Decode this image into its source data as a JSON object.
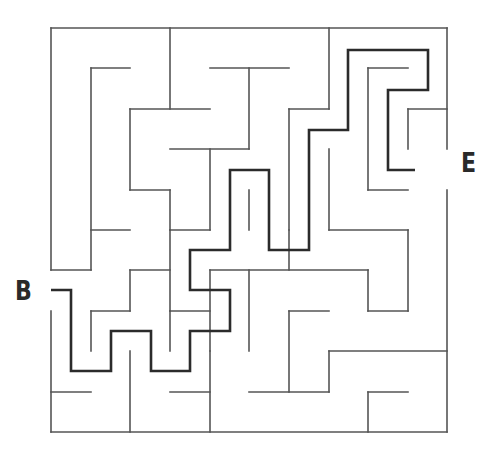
{
  "puzzle": {
    "type": "maze",
    "start_label": "B",
    "end_label": "E",
    "colors": {
      "wall": "#555555",
      "path": "#2b2b2b",
      "background": "#ffffff"
    },
    "walls": [
      [
        51,
        28,
        447,
        28
      ],
      [
        51,
        28,
        51,
        270
      ],
      [
        51,
        311,
        51,
        432
      ],
      [
        51,
        432,
        447,
        432
      ],
      [
        447,
        28,
        447,
        149
      ],
      [
        447,
        190,
        447,
        432
      ],
      [
        170,
        28,
        170,
        109
      ],
      [
        329,
        28,
        329,
        109
      ],
      [
        91,
        68,
        130,
        68
      ],
      [
        91,
        68,
        91,
        270
      ],
      [
        210,
        68,
        289,
        68
      ],
      [
        249,
        68,
        249,
        149
      ],
      [
        289,
        109,
        329,
        109
      ],
      [
        289,
        109,
        289,
        230
      ],
      [
        130,
        109,
        210,
        109
      ],
      [
        130,
        109,
        130,
        190
      ],
      [
        130,
        190,
        170,
        190
      ],
      [
        170,
        190,
        170,
        230
      ],
      [
        170,
        149,
        249,
        149
      ],
      [
        210,
        149,
        210,
        230
      ],
      [
        170,
        230,
        210,
        230
      ],
      [
        170,
        230,
        170,
        311
      ],
      [
        51,
        270,
        91,
        270
      ],
      [
        91,
        230,
        130,
        230
      ],
      [
        368,
        68,
        408,
        68
      ],
      [
        368,
        68,
        368,
        190
      ],
      [
        368,
        190,
        408,
        190
      ],
      [
        408,
        109,
        447,
        109
      ],
      [
        408,
        109,
        408,
        149
      ],
      [
        329,
        149,
        329,
        230
      ],
      [
        329,
        230,
        408,
        230
      ],
      [
        408,
        230,
        408,
        311
      ],
      [
        368,
        311,
        408,
        311
      ],
      [
        368,
        270,
        368,
        311
      ],
      [
        210,
        270,
        368,
        270
      ],
      [
        249,
        190,
        249,
        230
      ],
      [
        289,
        230,
        289,
        270
      ],
      [
        130,
        270,
        170,
        270
      ],
      [
        130,
        270,
        130,
        311
      ],
      [
        91,
        311,
        130,
        311
      ],
      [
        91,
        311,
        91,
        351
      ],
      [
        170,
        311,
        210,
        311
      ],
      [
        210,
        270,
        210,
        351
      ],
      [
        210,
        351,
        210,
        432
      ],
      [
        249,
        270,
        249,
        351
      ],
      [
        289,
        311,
        329,
        311
      ],
      [
        289,
        311,
        289,
        392
      ],
      [
        249,
        392,
        329,
        392
      ],
      [
        329,
        351,
        447,
        351
      ],
      [
        329,
        351,
        329,
        392
      ],
      [
        368,
        392,
        408,
        392
      ],
      [
        368,
        392,
        368,
        432
      ],
      [
        51,
        392,
        91,
        392
      ],
      [
        130,
        351,
        130,
        432
      ],
      [
        170,
        392,
        210,
        392
      ],
      [
        170,
        311,
        170,
        351
      ]
    ],
    "solution_path": [
      [
        51,
        290
      ],
      [
        71,
        290
      ],
      [
        71,
        371
      ],
      [
        111,
        371
      ],
      [
        111,
        331
      ],
      [
        151,
        331
      ],
      [
        151,
        371
      ],
      [
        190,
        371
      ],
      [
        190,
        331
      ],
      [
        230,
        331
      ],
      [
        230,
        290
      ],
      [
        190,
        290
      ],
      [
        190,
        250
      ],
      [
        230,
        250
      ],
      [
        230,
        170
      ],
      [
        269,
        170
      ],
      [
        269,
        250
      ],
      [
        309,
        250
      ],
      [
        309,
        130
      ],
      [
        348,
        130
      ],
      [
        348,
        50
      ],
      [
        428,
        50
      ],
      [
        428,
        90
      ],
      [
        388,
        90
      ],
      [
        388,
        170
      ],
      [
        415,
        170
      ]
    ]
  }
}
